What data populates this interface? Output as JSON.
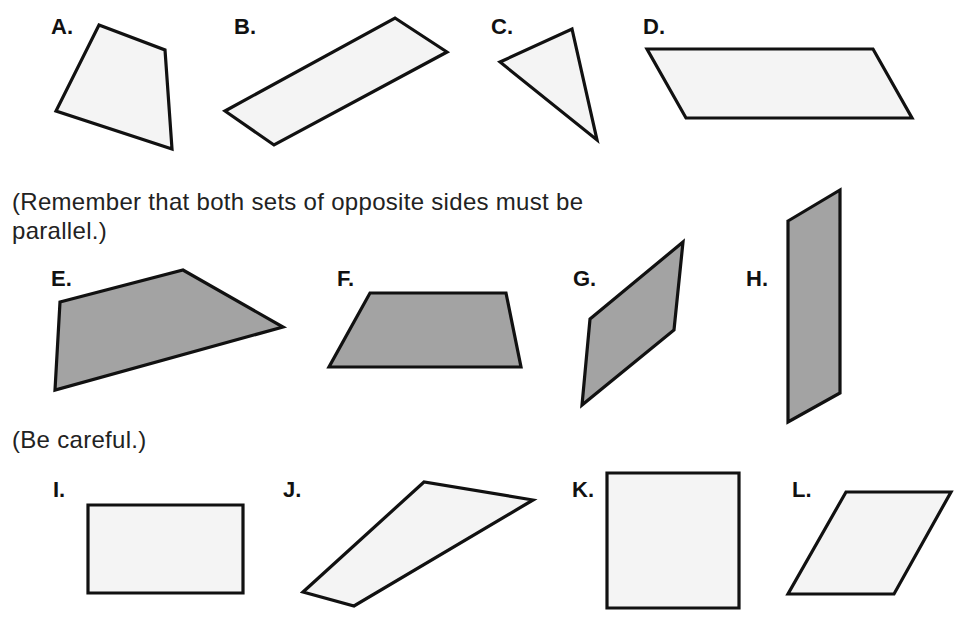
{
  "notes": {
    "remember_line1": "(Remember that both sets of opposite sides must be",
    "remember_line2": "parallel.)",
    "careful": "(Be careful.)"
  },
  "colors": {
    "light_fill": "#f4f4f4",
    "dark_fill": "#a3a3a3",
    "stroke": "#111111"
  },
  "shapes": [
    {
      "label": "A.",
      "fill": "light",
      "points": "99,25 165,50 172,149 56,111"
    },
    {
      "label": "B.",
      "fill": "light",
      "points": "225,111 395,18 447,52 274,145"
    },
    {
      "label": "C.",
      "fill": "light",
      "points": "500,62 572,29 597,140"
    },
    {
      "label": "D.",
      "fill": "light",
      "points": "647,49 873,49 912,118 686,118"
    },
    {
      "label": "E.",
      "fill": "dark",
      "points": "60,302 183,270 283,327 55,390"
    },
    {
      "label": "F.",
      "fill": "dark",
      "points": "370,293 506,293 521,367 329,367"
    },
    {
      "label": "G.",
      "fill": "dark",
      "points": "590,319 683,242 674,330 582,405"
    },
    {
      "label": "H.",
      "fill": "dark",
      "points": "788,221 840,190 840,393 788,422"
    },
    {
      "label": "I.",
      "fill": "light",
      "points": "88,505 243,505 243,593 88,593"
    },
    {
      "label": "J.",
      "fill": "light",
      "points": "303,592 424,482 533,500 354,606"
    },
    {
      "label": "K.",
      "fill": "light",
      "points": "607,473 739,473 739,608 607,608"
    },
    {
      "label": "L.",
      "fill": "light",
      "points": "846,492 951,492 894,594 788,594"
    }
  ]
}
